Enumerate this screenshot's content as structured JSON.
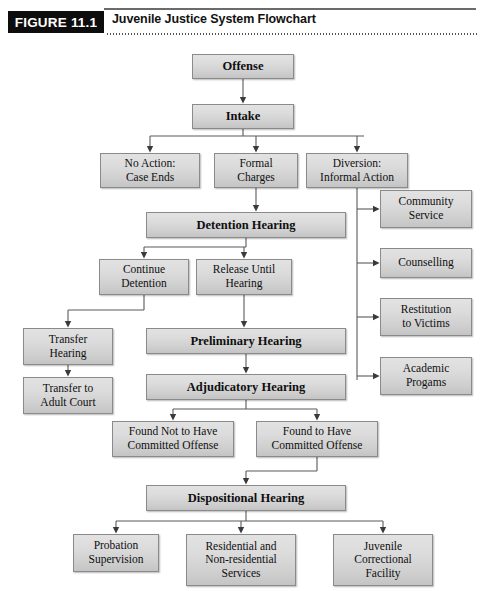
{
  "header": {
    "badge": "FIGURE 11.1",
    "title": "Juvenile Justice System Flowchart"
  },
  "chart_data": {
    "type": "diagram",
    "title": "Juvenile Justice System Flowchart",
    "nodes": [
      {
        "id": "offense",
        "label": "Offense",
        "x": 192,
        "y": 8,
        "w": 102,
        "h": 25,
        "style": "bold"
      },
      {
        "id": "intake",
        "label": "Intake",
        "x": 192,
        "y": 58,
        "w": 102,
        "h": 25,
        "style": "bold"
      },
      {
        "id": "no_action",
        "label": "No Action:\nCase Ends",
        "x": 100,
        "y": 107,
        "w": 100,
        "h": 35,
        "style": "small"
      },
      {
        "id": "formal_charges",
        "label": "Formal\nCharges",
        "x": 214,
        "y": 107,
        "w": 84,
        "h": 35,
        "style": "small"
      },
      {
        "id": "diversion",
        "label": "Diversion:\nInformal Action",
        "x": 306,
        "y": 107,
        "w": 102,
        "h": 35,
        "style": "small"
      },
      {
        "id": "detention_hearing",
        "label": "Detention Hearing",
        "x": 146,
        "y": 166,
        "w": 200,
        "h": 26,
        "style": "bold"
      },
      {
        "id": "continue_detention",
        "label": "Continue\nDetention",
        "x": 99,
        "y": 213,
        "w": 90,
        "h": 36,
        "style": "small"
      },
      {
        "id": "release_until",
        "label": "Release Until\nHearing",
        "x": 196,
        "y": 213,
        "w": 96,
        "h": 36,
        "style": "small"
      },
      {
        "id": "community_service",
        "label": "Community\nService",
        "x": 380,
        "y": 144,
        "w": 92,
        "h": 38,
        "style": "small"
      },
      {
        "id": "counselling",
        "label": "Counselling",
        "x": 380,
        "y": 202,
        "w": 92,
        "h": 30,
        "style": "small"
      },
      {
        "id": "restitution",
        "label": "Restitution\nto Victims",
        "x": 380,
        "y": 252,
        "w": 92,
        "h": 38,
        "style": "small"
      },
      {
        "id": "academic",
        "label": "Academic\nProgams",
        "x": 380,
        "y": 311,
        "w": 92,
        "h": 38,
        "style": "small"
      },
      {
        "id": "transfer_hearing",
        "label": "Transfer\nHearing",
        "x": 23,
        "y": 282,
        "w": 90,
        "h": 37,
        "style": "small"
      },
      {
        "id": "transfer_adult",
        "label": "Transfer to\nAdult Court",
        "x": 23,
        "y": 331,
        "w": 90,
        "h": 37,
        "style": "small"
      },
      {
        "id": "preliminary_hearing",
        "label": "Preliminary Hearing",
        "x": 146,
        "y": 282,
        "w": 200,
        "h": 26,
        "style": "bold"
      },
      {
        "id": "adjudicatory_hearing",
        "label": "Adjudicatory Hearing",
        "x": 146,
        "y": 328,
        "w": 200,
        "h": 26,
        "style": "bold"
      },
      {
        "id": "found_not",
        "label": "Found Not to Have\nCommitted Offense",
        "x": 112,
        "y": 375,
        "w": 122,
        "h": 36,
        "style": "small"
      },
      {
        "id": "found_yes",
        "label": "Found to Have\nCommitted Offense",
        "x": 256,
        "y": 375,
        "w": 122,
        "h": 36,
        "style": "small"
      },
      {
        "id": "dispositional_hearing",
        "label": "Dispositional Hearing",
        "x": 146,
        "y": 439,
        "w": 200,
        "h": 26,
        "style": "bold"
      },
      {
        "id": "probation",
        "label": "Probation\nSupervision",
        "x": 73,
        "y": 488,
        "w": 86,
        "h": 38,
        "style": "small"
      },
      {
        "id": "residential",
        "label": "Residential and\nNon-residential\nServices",
        "x": 186,
        "y": 488,
        "w": 110,
        "h": 52,
        "style": "small"
      },
      {
        "id": "juvenile_facility",
        "label": "Juvenile\nCorrectional\nFacility",
        "x": 333,
        "y": 488,
        "w": 100,
        "h": 52,
        "style": "small"
      }
    ],
    "edges": [
      {
        "from": "offense",
        "to": "intake"
      },
      {
        "from": "intake",
        "to": "no_action"
      },
      {
        "from": "intake",
        "to": "formal_charges"
      },
      {
        "from": "intake",
        "to": "diversion"
      },
      {
        "from": "formal_charges",
        "to": "detention_hearing"
      },
      {
        "from": "diversion",
        "to": "community_service"
      },
      {
        "from": "diversion",
        "to": "counselling"
      },
      {
        "from": "diversion",
        "to": "restitution"
      },
      {
        "from": "diversion",
        "to": "academic"
      },
      {
        "from": "detention_hearing",
        "to": "continue_detention"
      },
      {
        "from": "detention_hearing",
        "to": "release_until"
      },
      {
        "from": "continue_detention",
        "to": "transfer_hearing"
      },
      {
        "from": "continue_detention",
        "to": "preliminary_hearing"
      },
      {
        "from": "release_until",
        "to": "preliminary_hearing"
      },
      {
        "from": "transfer_hearing",
        "to": "transfer_adult"
      },
      {
        "from": "preliminary_hearing",
        "to": "adjudicatory_hearing"
      },
      {
        "from": "adjudicatory_hearing",
        "to": "found_not"
      },
      {
        "from": "adjudicatory_hearing",
        "to": "found_yes"
      },
      {
        "from": "found_yes",
        "to": "dispositional_hearing"
      },
      {
        "from": "dispositional_hearing",
        "to": "probation"
      },
      {
        "from": "dispositional_hearing",
        "to": "residential"
      },
      {
        "from": "dispositional_hearing",
        "to": "juvenile_facility"
      }
    ]
  }
}
